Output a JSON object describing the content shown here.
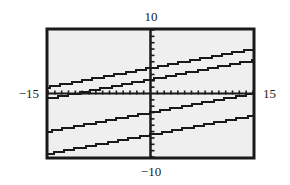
{
  "chart_data": {
    "type": "line",
    "title": "",
    "xlabel": "",
    "ylabel": "",
    "xlim": [
      -15,
      15
    ],
    "ylim": [
      -10,
      10
    ],
    "xtick_spacing": 1,
    "ytick_spacing": 1,
    "grid": false,
    "window_labels": {
      "xmin": "−15",
      "xmax": "15",
      "ymin": "−10",
      "ymax": "10"
    },
    "series": [
      {
        "name": "line-1",
        "slope": 0.2,
        "intercept": 4
      },
      {
        "name": "line-2",
        "slope": 0.2,
        "intercept": 2.2
      },
      {
        "name": "line-3",
        "slope": 0.2,
        "intercept": -3
      },
      {
        "name": "line-4",
        "slope": 0.2,
        "intercept": -6.5
      }
    ],
    "colors": {
      "background": "#efefef",
      "frame": "#1a1a1a",
      "line": "#1a1a1a"
    }
  }
}
